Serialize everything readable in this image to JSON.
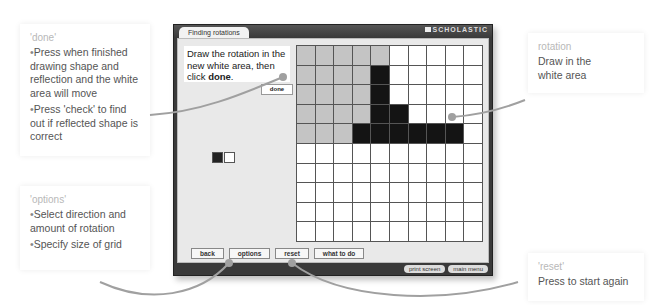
{
  "callouts": {
    "done": {
      "title": "'done'",
      "lines": [
        "Press when finished drawing shape and reflection and the white area will move",
        "Press 'check' to find out if reflected shape is correct"
      ]
    },
    "options": {
      "title": "'options'",
      "lines": [
        "Select direction and amount of rotation",
        "Specify size of grid"
      ]
    },
    "rotation": {
      "title": "rotation",
      "lines": [
        "Draw in the white area"
      ]
    },
    "reset": {
      "title": "'reset'",
      "lines": [
        "Press to start again"
      ]
    }
  },
  "window": {
    "tab_title": "Finding rotations",
    "brand": "SCHOLASTIC",
    "instruction_pre": "Draw the rotation in the new white area, then click ",
    "instruction_bold": "done",
    "instruction_post": ".",
    "done_label": "done",
    "swatches": [
      "black",
      "white"
    ],
    "grid": {
      "cols": 10,
      "rows": 10,
      "cells": [
        "ggggg.....",
        "ggggb.....",
        "ggggb.....",
        "ggggbb....",
        "gggbbbbbb.",
        "..........",
        "..........",
        "..........",
        "..........",
        ".........."
      ]
    },
    "buttons": {
      "back": "back",
      "options": "options",
      "reset": "reset",
      "what_to_do": "what to do"
    },
    "footer": {
      "print_screen": "print screen",
      "main_menu": "main menu"
    }
  },
  "colors": {
    "connector": "#a0a0a0",
    "shaded_cell": "#c4c4c4",
    "filled_cell": "#141414"
  }
}
